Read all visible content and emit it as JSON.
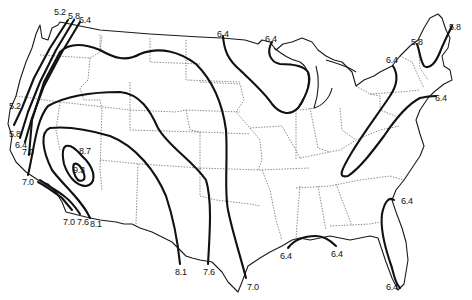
{
  "map": {
    "type": "contour map",
    "region": "contiguous United States",
    "background": "#ffffff",
    "line_color": "#111111",
    "contour_values": [
      "5.2",
      "5.8",
      "6.4",
      "7.0",
      "7.6",
      "8.1",
      "8.7",
      "9.3"
    ],
    "labels": [
      {
        "id": "nw-52-top",
        "text": "5.2",
        "x": 54,
        "y": 8
      },
      {
        "id": "nw-58-top",
        "text": "5.8",
        "x": 68,
        "y": 12
      },
      {
        "id": "nw-64-top",
        "text": "6.4",
        "x": 79,
        "y": 16
      },
      {
        "id": "w-52",
        "text": "5.2",
        "x": 9,
        "y": 102
      },
      {
        "id": "w-58",
        "text": "5.8",
        "x": 9,
        "y": 130
      },
      {
        "id": "w-64",
        "text": "6.4",
        "x": 15,
        "y": 141
      },
      {
        "id": "w-70-a",
        "text": "7.0",
        "x": 22,
        "y": 148
      },
      {
        "id": "w-70-b",
        "text": "7.0",
        "x": 22,
        "y": 178
      },
      {
        "id": "sw-70",
        "text": "7.0",
        "x": 63,
        "y": 218
      },
      {
        "id": "sw-76",
        "text": "7.6",
        "x": 77,
        "y": 218
      },
      {
        "id": "sw-81",
        "text": "8.1",
        "x": 90,
        "y": 220
      },
      {
        "id": "peak-87",
        "text": "8.7",
        "x": 79,
        "y": 147
      },
      {
        "id": "peak-93",
        "text": "9.3",
        "x": 73,
        "y": 166
      },
      {
        "id": "tx-81",
        "text": "8.1",
        "x": 175,
        "y": 268
      },
      {
        "id": "tx-76",
        "text": "7.6",
        "x": 203,
        "y": 268
      },
      {
        "id": "tx-70",
        "text": "7.0",
        "x": 247,
        "y": 283
      },
      {
        "id": "n-64-a",
        "text": "6.4",
        "x": 217,
        "y": 30
      },
      {
        "id": "n-64-b",
        "text": "6.4",
        "x": 265,
        "y": 35
      },
      {
        "id": "gulf-64-a",
        "text": "6.4",
        "x": 280,
        "y": 252
      },
      {
        "id": "gulf-64-b",
        "text": "6.4",
        "x": 331,
        "y": 250
      },
      {
        "id": "fl-64-a",
        "text": "6.4",
        "x": 401,
        "y": 197
      },
      {
        "id": "fl-64-b",
        "text": "6.4",
        "x": 386,
        "y": 283
      },
      {
        "id": "ne-64-a",
        "text": "6.4",
        "x": 386,
        "y": 56
      },
      {
        "id": "ne-58-a",
        "text": "5.8",
        "x": 411,
        "y": 38
      },
      {
        "id": "ne-58-b",
        "text": "5.8",
        "x": 449,
        "y": 23
      },
      {
        "id": "ne-64-b",
        "text": "6.4",
        "x": 435,
        "y": 94
      }
    ]
  }
}
